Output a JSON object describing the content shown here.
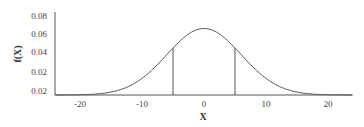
{
  "chart_data": {
    "type": "line",
    "title": "",
    "xlabel": "X",
    "ylabel": "f(X)",
    "xlim": [
      -24,
      24
    ],
    "ylim": [
      0.0,
      0.08
    ],
    "x_ticks": [
      "-20",
      "-10",
      "0",
      "10",
      "20"
    ],
    "y_ticks": [
      "0.08",
      "0.06",
      "0.04",
      "0.02",
      "0.02"
    ],
    "grid": false,
    "legend": "none",
    "series": [
      {
        "name": "normal density",
        "distribution": "normal",
        "mean": 0,
        "sd": 6,
        "x": [
          -24,
          -20,
          -16,
          -12,
          -10,
          -8,
          -6,
          -4,
          -2,
          0,
          2,
          4,
          6,
          8,
          10,
          12,
          16,
          20,
          24
        ],
        "values": [
          0.0,
          0.0003,
          0.0019,
          0.009,
          0.0166,
          0.0273,
          0.0403,
          0.0532,
          0.0629,
          0.0665,
          0.0629,
          0.0532,
          0.0403,
          0.0273,
          0.0166,
          0.009,
          0.0019,
          0.0003,
          0.0
        ]
      }
    ],
    "annotations": [
      {
        "type": "vertical-line",
        "x": -5,
        "description": "left bound of shaded interval"
      },
      {
        "type": "vertical-line",
        "x": 5,
        "description": "right bound of shaded interval"
      }
    ]
  }
}
